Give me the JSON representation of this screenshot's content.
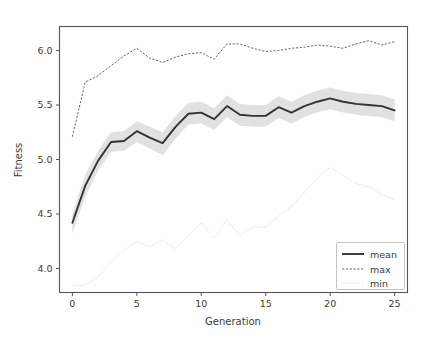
{
  "chart_data": {
    "type": "line",
    "title": "",
    "xlabel": "Generation",
    "ylabel": "Fitness",
    "xlim": [
      -1.0,
      26.0
    ],
    "ylim": [
      3.78,
      6.22
    ],
    "xticks": [
      0,
      5,
      10,
      15,
      20,
      25
    ],
    "yticks": [
      4.0,
      4.5,
      5.0,
      5.5,
      6.0
    ],
    "xtick_labels": [
      "0",
      "5",
      "10",
      "15",
      "20",
      "25"
    ],
    "ytick_labels": [
      "4.0",
      "4.5",
      "5.0",
      "5.5",
      "6.0"
    ],
    "grid": false,
    "legend_position": "lower right",
    "x": [
      0,
      1,
      2,
      3,
      4,
      5,
      6,
      7,
      8,
      9,
      10,
      11,
      12,
      13,
      14,
      15,
      16,
      17,
      18,
      19,
      20,
      21,
      22,
      23,
      24,
      25
    ],
    "series": [
      {
        "name": "mean",
        "style": "solid",
        "color": "#333333",
        "linewidth": 1.9,
        "values": [
          4.42,
          4.76,
          4.99,
          5.16,
          5.17,
          5.26,
          5.2,
          5.15,
          5.3,
          5.42,
          5.43,
          5.37,
          5.49,
          5.41,
          5.4,
          5.4,
          5.48,
          5.43,
          5.49,
          5.53,
          5.56,
          5.53,
          5.51,
          5.5,
          5.49,
          5.45
        ],
        "band": {
          "name": "mean +/- std",
          "color": "#c9c9c9",
          "alpha": 0.55,
          "lower": [
            4.32,
            4.66,
            4.9,
            5.07,
            5.08,
            5.16,
            5.1,
            5.04,
            5.19,
            5.32,
            5.33,
            5.27,
            5.39,
            5.31,
            5.3,
            5.3,
            5.38,
            5.33,
            5.39,
            5.43,
            5.46,
            5.43,
            5.41,
            5.4,
            5.39,
            5.35
          ],
          "upper": [
            4.5,
            4.86,
            5.08,
            5.25,
            5.26,
            5.35,
            5.3,
            5.25,
            5.4,
            5.52,
            5.53,
            5.47,
            5.59,
            5.51,
            5.5,
            5.5,
            5.58,
            5.53,
            5.59,
            5.63,
            5.66,
            5.63,
            5.61,
            5.6,
            5.59,
            5.55
          ]
        }
      },
      {
        "name": "max",
        "style": "dashed",
        "color": "#555555",
        "linewidth": 0.9,
        "values": [
          5.21,
          5.71,
          5.77,
          5.86,
          5.95,
          6.02,
          5.93,
          5.89,
          5.94,
          5.97,
          5.98,
          5.92,
          6.06,
          6.06,
          6.02,
          5.99,
          6.0,
          6.02,
          6.03,
          6.05,
          6.04,
          6.02,
          6.06,
          6.09,
          6.05,
          6.08
        ]
      },
      {
        "name": "min",
        "style": "dotted",
        "color": "#d6d6d6",
        "linewidth": 0.9,
        "values": [
          3.84,
          3.85,
          3.92,
          4.06,
          4.17,
          4.25,
          4.2,
          4.26,
          4.18,
          4.3,
          4.42,
          4.28,
          4.45,
          4.3,
          4.38,
          4.38,
          4.48,
          4.57,
          4.7,
          4.83,
          4.93,
          4.85,
          4.78,
          4.75,
          4.68,
          4.63
        ]
      }
    ]
  },
  "legend": {
    "entries": [
      {
        "label": "mean"
      },
      {
        "label": "max"
      },
      {
        "label": "min"
      }
    ]
  },
  "axes": {
    "ylabel": "Fitness",
    "xlabel": "Generation"
  }
}
